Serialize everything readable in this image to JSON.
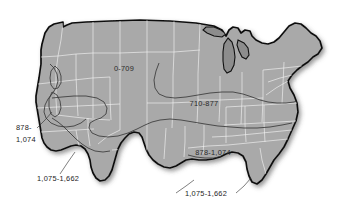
{
  "figure": {
    "kind": "choropleth-contour-map",
    "region": "United States",
    "background_color": "#ffffff",
    "land_fill_color": "#a9a9a9",
    "outline_color": "#111111",
    "state_border_color": "#f2f2f2",
    "contour_color": "#3a3a3a",
    "label_color": "#2b2b2b",
    "lake_fill_color": "#8d8d8d"
  },
  "zone_labels": [
    {
      "id": "zone-0-709",
      "text": "0-709",
      "range_low": 0,
      "range_high": 709,
      "placement": "interior",
      "x": 124,
      "y": 71
    },
    {
      "id": "zone-710-877",
      "text": "710-877",
      "range_low": 710,
      "range_high": 877,
      "placement": "interior",
      "x": 204,
      "y": 106
    },
    {
      "id": "zone-878-1074-interior",
      "text": "878-1,074",
      "range_low": 878,
      "range_high": 1074,
      "placement": "interior",
      "x": 213,
      "y": 155
    }
  ],
  "callouts": [
    {
      "id": "callout-878-1074-west",
      "line1": "878-",
      "line2": "1,074",
      "range_low": 878,
      "range_high": 1074,
      "placement": "left-exterior",
      "x": 17,
      "y": 131
    },
    {
      "id": "callout-1075-1662-west",
      "text": "1,075-1,662",
      "range_low": 1075,
      "range_high": 1662,
      "placement": "lower-left-exterior",
      "x": 37,
      "y": 180
    },
    {
      "id": "callout-1075-1662-south",
      "text": "1,075-1,662",
      "range_low": 1075,
      "range_high": 1662,
      "placement": "bottom-exterior",
      "x": 204,
      "y": 198
    }
  ],
  "legend_summary": {
    "bands": [
      "0-709",
      "710-877",
      "878-1,074",
      "1,075-1,662"
    ]
  }
}
